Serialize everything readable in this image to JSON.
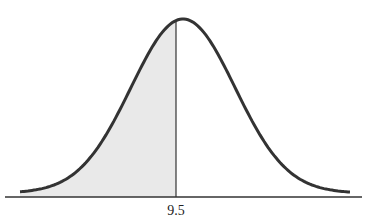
{
  "chart_data": {
    "type": "area",
    "title": "",
    "xlabel": "",
    "ylabel": "",
    "tick_labels": [
      "9.5"
    ],
    "marked_value": 9.5,
    "shaded_region": "left of 9.5",
    "grid": false,
    "legend": null,
    "colors": {
      "curve": "#333333",
      "shade": "#e8e8e8",
      "axis": "#333333"
    }
  }
}
